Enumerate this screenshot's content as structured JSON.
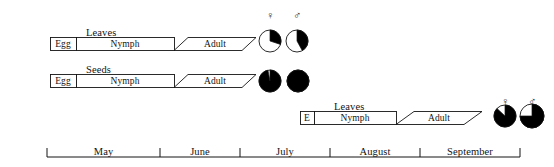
{
  "figure": {
    "title": "",
    "background_color": "#ffffff",
    "line_color": "#141414",
    "fill_dark": "#000000",
    "fill_light": "#ffffff"
  },
  "symbols": {
    "female": "♀",
    "male": "♂",
    "female_name": "female-symbol",
    "male_name": "male-symbol"
  },
  "axis": {
    "label": "",
    "months": [
      "May",
      "June",
      "July",
      "August",
      "September"
    ],
    "tick_positions_px": [
      47,
      160,
      240,
      330,
      420,
      520
    ],
    "baseline_y_px": 157,
    "tick_height_px": 9,
    "start_px": 47,
    "end_px": 520
  },
  "rows": [
    {
      "id": "row-leaves-early",
      "host": "Leaves",
      "host_label_x_px": 86,
      "host_label_y_px": 27,
      "bar_top_px": 37,
      "bar_height_px": 13,
      "egg": {
        "label": "Egg",
        "x_px": 50,
        "width_px": 26
      },
      "nymph": {
        "label": "Nymph",
        "x_px": 76,
        "width_px": 98
      },
      "adult": {
        "label": "Adult",
        "x_px": 174,
        "width_px": 82,
        "slant_px": 14
      },
      "pies": [
        {
          "sex": "female",
          "cx_px": 270,
          "cy_px": 41,
          "r_px": 11,
          "black_fraction": 0.3,
          "black_start_deg": 0
        },
        {
          "sex": "male",
          "cx_px": 297,
          "cy_px": 41,
          "r_px": 11,
          "black_fraction": 0.42,
          "black_start_deg": 0
        }
      ],
      "symbol_y_px": 9,
      "symbol_positions_px": [
        270,
        297
      ]
    },
    {
      "id": "row-seeds",
      "host": "Seeds",
      "host_label_x_px": 86,
      "host_label_y_px": 64,
      "bar_top_px": 74,
      "bar_height_px": 13,
      "egg": {
        "label": "Egg",
        "x_px": 50,
        "width_px": 26
      },
      "nymph": {
        "label": "Nymph",
        "x_px": 76,
        "width_px": 98
      },
      "adult": {
        "label": "Adult",
        "x_px": 174,
        "width_px": 82,
        "slant_px": 14
      },
      "pies": [
        {
          "sex": "female",
          "cx_px": 270,
          "cy_px": 81,
          "r_px": 11,
          "black_fraction": 0.97,
          "black_start_deg": 0
        },
        {
          "sex": "male",
          "cx_px": 298,
          "cy_px": 81,
          "r_px": 11,
          "black_fraction": 1.0,
          "black_start_deg": 0
        }
      ],
      "symbol_y_px": null,
      "symbol_positions_px": []
    },
    {
      "id": "row-leaves-late",
      "host": "Leaves",
      "host_label_x_px": 334,
      "host_label_y_px": 101,
      "bar_top_px": 111,
      "bar_height_px": 13,
      "egg": {
        "label": "E",
        "x_px": 300,
        "width_px": 14
      },
      "nymph": {
        "label": "Nymph",
        "x_px": 314,
        "width_px": 82
      },
      "adult": {
        "label": "Adult",
        "x_px": 396,
        "width_px": 86,
        "slant_px": 18
      },
      "pies": [
        {
          "sex": "female",
          "cx_px": 505,
          "cy_px": 116,
          "r_px": 11,
          "black_fraction": 0.87,
          "black_start_deg": 0
        },
        {
          "sex": "male",
          "cx_px": 532,
          "cy_px": 116,
          "r_px": 12,
          "black_fraction": 0.75,
          "black_start_deg": 0
        }
      ],
      "symbol_y_px": 95,
      "symbol_positions_px": [
        505,
        532
      ]
    }
  ],
  "chart_data": {
    "type": "timeline",
    "title": "",
    "xlabel": "",
    "ylabel": "",
    "x_axis": {
      "type": "category",
      "categories": [
        "May",
        "June",
        "July",
        "August",
        "September"
      ],
      "range_px": [
        47,
        520
      ]
    },
    "legend": [
      "♀ female",
      "♂ male"
    ],
    "grid": false,
    "series": [
      {
        "name": "Leaves (first generation)",
        "host": "Leaves",
        "stages": [
          {
            "stage": "Egg",
            "start_month": "May",
            "end_month": "May"
          },
          {
            "stage": "Nymph",
            "start_month": "May",
            "end_month": "June"
          },
          {
            "stage": "Adult",
            "start_month": "June",
            "end_month": "July"
          }
        ],
        "sex_ratio_pies": [
          {
            "sex": "female",
            "black_fraction": 0.3
          },
          {
            "sex": "male",
            "black_fraction": 0.42
          }
        ]
      },
      {
        "name": "Seeds",
        "host": "Seeds",
        "stages": [
          {
            "stage": "Egg",
            "start_month": "May",
            "end_month": "May"
          },
          {
            "stage": "Nymph",
            "start_month": "May",
            "end_month": "June"
          },
          {
            "stage": "Adult",
            "start_month": "June",
            "end_month": "July"
          }
        ],
        "sex_ratio_pies": [
          {
            "sex": "female",
            "black_fraction": 0.97
          },
          {
            "sex": "male",
            "black_fraction": 1.0
          }
        ]
      },
      {
        "name": "Leaves (second generation)",
        "host": "Leaves",
        "stages": [
          {
            "stage": "E",
            "start_month": "July",
            "end_month": "July"
          },
          {
            "stage": "Nymph",
            "start_month": "July",
            "end_month": "August"
          },
          {
            "stage": "Adult",
            "start_month": "August",
            "end_month": "September"
          }
        ],
        "sex_ratio_pies": [
          {
            "sex": "female",
            "black_fraction": 0.87
          },
          {
            "sex": "male",
            "black_fraction": 0.75
          }
        ]
      }
    ]
  }
}
